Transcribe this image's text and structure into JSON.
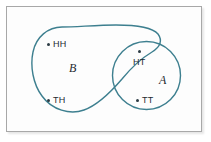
{
  "figure": {
    "type": "venn-diagram",
    "frame": {
      "border_color": "#a8a8a8",
      "background_color": "#fdfdfd"
    },
    "curve_color": "#3d7f8f",
    "dot_color": "#2c3b44",
    "sets": [
      {
        "id": "A",
        "label": "A",
        "shape": "circle"
      },
      {
        "id": "B",
        "label": "B",
        "shape": "blob"
      }
    ],
    "points": [
      {
        "id": "HH",
        "label": "HH",
        "region": "B-only"
      },
      {
        "id": "TH",
        "label": "TH",
        "region": "B-only"
      },
      {
        "id": "HT",
        "label": "HT",
        "region": "A-and-B"
      },
      {
        "id": "TT",
        "label": "TT",
        "region": "A-only"
      }
    ]
  }
}
